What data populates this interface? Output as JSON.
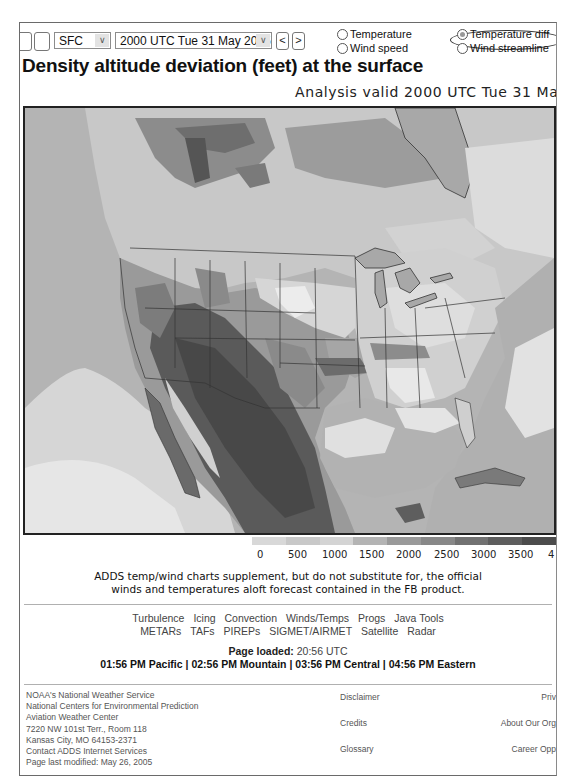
{
  "toolbar": {
    "level_select": {
      "value": "SFC"
    },
    "time_select": {
      "value": "2000 UTC Tue 31 May 2005"
    },
    "prev_label": "<",
    "next_label": ">",
    "radio_options": [
      {
        "label": "Temperature",
        "checked": false
      },
      {
        "label": "Wind speed",
        "checked": false
      },
      {
        "label": "Temperature diff",
        "checked": true
      },
      {
        "label": "Wind streamline",
        "checked": false
      }
    ]
  },
  "header": {
    "title": "Density altitude deviation (feet) at the surface",
    "subtitle": "Analysis valid 2000 UTC Tue 31 May"
  },
  "map": {
    "description": "Grayscale density altitude deviation map of North America (Canada, US, Mexico, Gulf of Mexico, Caribbean)",
    "colors": {
      "level_0": "#e6e6e6",
      "level_500": "#d2d2d2",
      "level_1000": "#bcbcbc",
      "level_1500": "#a4a4a4",
      "level_2000": "#8c8c8c",
      "level_2500": "#747474",
      "level_3000": "#5e5e5e",
      "level_3500": "#4a4a4a"
    }
  },
  "legend": {
    "labels": [
      "0",
      "500",
      "1000",
      "1500",
      "2000",
      "2500",
      "3000",
      "3500",
      "4"
    ],
    "swatches": [
      "#d8d8d8",
      "#c8c8c8",
      "#d4d4d4",
      "#b4b4b4",
      "#9a9a9a",
      "#888888",
      "#727272",
      "#5e5e5e",
      "#4c4c4c"
    ]
  },
  "disclaimer": {
    "line1": "ADDS temp/wind charts supplement, but do not substitute for, the official",
    "line2": "winds and temperatures aloft forecast contained in the FB product."
  },
  "nav_links": {
    "row1": [
      "Turbulence",
      "Icing",
      "Convection",
      "Winds/Temps",
      "Progs",
      "Java Tools"
    ],
    "row2": [
      "METARs",
      "TAFs",
      "PIREPs",
      "SIGMET/AIRMET",
      "Satellite",
      "Radar"
    ]
  },
  "page_loaded": {
    "label": "Page loaded:",
    "value": "20:56 UTC",
    "times": [
      "01:56 PM Pacific",
      "02:56 PM Mountain",
      "03:56 PM Central",
      "04:56 PM Eastern"
    ],
    "separator": " | "
  },
  "footer": {
    "address": [
      "NOAA's National Weather Service",
      "National Centers for Environmental Prediction",
      "Aviation Weather Center",
      "7220 NW 101st Terr., Room 118",
      "Kansas City, MO 64153-2371",
      "Contact ADDS Internet Services",
      "Page last modified: May 26, 2005"
    ],
    "middle_links": [
      "Disclaimer",
      "Credits",
      "Glossary"
    ],
    "right_links": [
      "Priv",
      "About Our Org",
      "Career Opp"
    ]
  }
}
